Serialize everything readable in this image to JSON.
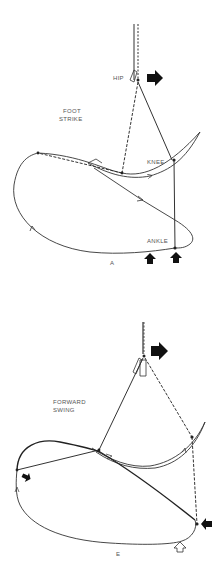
{
  "panels": [
    {
      "id": "A",
      "panel_label": "A",
      "phase_title_line1": "FOOT",
      "phase_title_line2": "STRIKE",
      "joint_labels": {
        "hip": "HIP",
        "knee": "KNEE",
        "ankle": "ANKLE"
      },
      "force_arrows": [
        "hip-forward-filled",
        "ground-up-filled",
        "ground-up-filled"
      ]
    },
    {
      "id": "E",
      "panel_label": "E",
      "phase_title_line1": "FORWARD",
      "phase_title_line2": "SWING",
      "force_arrows": [
        "hip-forward-filled",
        "ankle-left-filled",
        "knee-left-filled",
        "ground-up-outline"
      ]
    }
  ],
  "colors": {
    "line": "#222222",
    "label": "#555555",
    "background": "#ffffff"
  }
}
